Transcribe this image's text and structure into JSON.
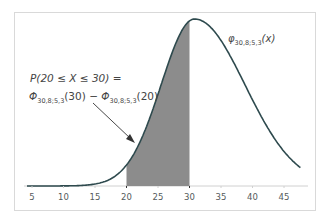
{
  "chart_data": {
    "type": "area",
    "title": "",
    "xlabel": "",
    "ylabel": "",
    "x_ticks": [
      5,
      10,
      15,
      20,
      25,
      30,
      35,
      40,
      45
    ],
    "xlim": [
      4,
      48
    ],
    "grid": false,
    "legend": "none",
    "distribution": {
      "name": "two-piece normal",
      "mode": 30.8,
      "sigma_left": 5.3,
      "sigma_right": 8.0
    },
    "series": [
      {
        "name": "φ_{30,8;5,3}(x)",
        "type": "line",
        "color": "#2e4a4e"
      },
      {
        "name": "shaded area 20..30",
        "type": "area",
        "x_from": 20,
        "x_to": 30,
        "color": "#8c8c8c"
      }
    ],
    "annotations": [
      {
        "text": "φ30,8;5,3(x)",
        "position": "upper right of peak"
      },
      {
        "text": "P(20 ≤ X ≤ 30) = Φ30,8;5,3(30) − Φ30,8;5,3(20)",
        "position": "left, arrow to shaded area"
      }
    ]
  },
  "labels": {
    "curve_fn": "φ",
    "curve_sub": "30,8;5,3",
    "curve_arg": "(x)",
    "prob_line1": "P(20 ≤ X ≤ 30) =",
    "cdf_fn": "Φ",
    "cdf_sub": "30,8;5,3",
    "cdf_arg1": "(30) − ",
    "cdf_arg2": "(20)"
  },
  "ticks": [
    "5",
    "10",
    "15",
    "20",
    "25",
    "30",
    "35",
    "40",
    "45"
  ],
  "colors": {
    "curve": "#2e4a4e",
    "shade": "#8c8c8c",
    "axis": "#d0d0d0",
    "frame": "#d9d9d9"
  }
}
